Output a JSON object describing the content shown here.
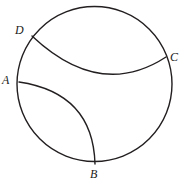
{
  "figure": {
    "kind": "geometry-diagram",
    "background_color": "#ffffff",
    "stroke_color": "#231f20",
    "stroke_width": 1.4,
    "labels": [
      {
        "id": "D",
        "text": "D",
        "x": 22,
        "y": 30
      },
      {
        "id": "A",
        "text": "A",
        "x": 8,
        "y": 80
      },
      {
        "id": "C",
        "text": "C",
        "x": 176,
        "y": 57
      },
      {
        "id": "B",
        "text": "B",
        "x": 95,
        "y": 174
      }
    ],
    "circle": {
      "name": "main-circle",
      "cx": 94.5,
      "cy": 84,
      "r": 77.5
    },
    "arcs": [
      {
        "name": "arc-D-C",
        "from": "D",
        "to": "C",
        "start": {
          "x": 32,
          "y": 36
        },
        "end": {
          "x": 166,
          "y": 57
        },
        "bulge": "downward",
        "path": "M 32 36 Q 100 100 166 57"
      },
      {
        "name": "arc-A-B",
        "from": "A",
        "to": "B",
        "start": {
          "x": 19,
          "y": 82
        },
        "end": {
          "x": 95,
          "y": 164
        },
        "bulge": "upper-right",
        "path": "M 19 82 Q 93 93 95 164"
      }
    ]
  }
}
